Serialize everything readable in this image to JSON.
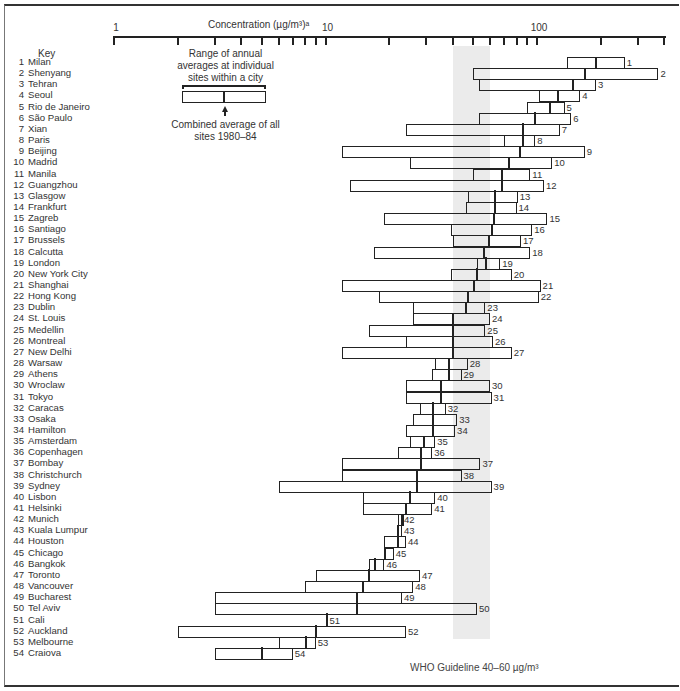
{
  "chart_data": {
    "type": "range-bar",
    "title": "Concentration (µg/m³)ᵃ",
    "xlabel": "Concentration (µg/m³)ᵃ",
    "xscale": "log",
    "xlim": [
      1,
      400
    ],
    "x_tick_labels": [
      "1",
      "10",
      "100"
    ],
    "x_ticks": [
      1,
      2,
      3,
      4,
      5,
      6,
      7,
      8,
      9,
      10,
      20,
      30,
      40,
      50,
      60,
      70,
      80,
      90,
      100,
      200,
      300,
      400
    ],
    "legend": {
      "title": "Key",
      "range_label": "Range of annual averages at individual sites within a city",
      "mid_label": "Combined average of all sites 1980–84"
    },
    "annotation": {
      "text": "WHO Guideline 40–60 µg/m³",
      "range": [
        40,
        60
      ]
    },
    "series": [
      {
        "n": 1,
        "city": "Milan",
        "min": 138,
        "avg": 190,
        "max": 260
      },
      {
        "n": 2,
        "city": "Shenyang",
        "min": 50,
        "avg": 168,
        "max": 375
      },
      {
        "n": 3,
        "city": "Tehran",
        "min": 53,
        "avg": 148,
        "max": 190
      },
      {
        "n": 4,
        "city": "Seoul",
        "min": 102,
        "avg": 125,
        "max": 160
      },
      {
        "n": 5,
        "city": "Rio de Janeiro",
        "min": 90,
        "avg": 115,
        "max": 135
      },
      {
        "n": 6,
        "city": "São Paulo",
        "min": 53,
        "avg": 97,
        "max": 145
      },
      {
        "n": 7,
        "city": "Xian",
        "min": 24,
        "avg": 85,
        "max": 128
      },
      {
        "n": 8,
        "city": "Paris",
        "min": 70,
        "avg": 85,
        "max": 98
      },
      {
        "n": 9,
        "city": "Beijing",
        "min": 12,
        "avg": 83,
        "max": 168
      },
      {
        "n": 10,
        "city": "Madrid",
        "min": 25,
        "avg": 73,
        "max": 118
      },
      {
        "n": 11,
        "city": "Manila",
        "min": 50,
        "avg": 68,
        "max": 93
      },
      {
        "n": 12,
        "city": "Guangzhou",
        "min": 13,
        "avg": 68,
        "max": 108
      },
      {
        "n": 13,
        "city": "Glasgow",
        "min": 47,
        "avg": 63,
        "max": 81
      },
      {
        "n": 14,
        "city": "Frankfurt",
        "min": 46,
        "avg": 63,
        "max": 80
      },
      {
        "n": 15,
        "city": "Zagreb",
        "min": 19,
        "avg": 62,
        "max": 112
      },
      {
        "n": 16,
        "city": "Santiago",
        "min": 39,
        "avg": 61,
        "max": 95
      },
      {
        "n": 17,
        "city": "Brussels",
        "min": 40,
        "avg": 59,
        "max": 84
      },
      {
        "n": 18,
        "city": "Calcutta",
        "min": 17,
        "avg": 56,
        "max": 93
      },
      {
        "n": 19,
        "city": "London",
        "min": 52,
        "avg": 57,
        "max": 67
      },
      {
        "n": 20,
        "city": "New York City",
        "min": 39,
        "avg": 52,
        "max": 76
      },
      {
        "n": 21,
        "city": "Shanghai",
        "min": 12,
        "avg": 50,
        "max": 104
      },
      {
        "n": 22,
        "city": "Hong Kong",
        "min": 18,
        "avg": 47,
        "max": 102
      },
      {
        "n": 23,
        "city": "Dublin",
        "min": 26,
        "avg": 46,
        "max": 57
      },
      {
        "n": 24,
        "city": "St. Louis",
        "min": 26,
        "avg": 40,
        "max": 60
      },
      {
        "n": 25,
        "city": "Medellin",
        "min": 16,
        "avg": 40,
        "max": 57
      },
      {
        "n": 26,
        "city": "Montreal",
        "min": 24,
        "avg": 40,
        "max": 62
      },
      {
        "n": 27,
        "city": "New Delhi",
        "min": 12,
        "avg": 40,
        "max": 76
      },
      {
        "n": 28,
        "city": "Warsaw",
        "min": 33,
        "avg": 38,
        "max": 47
      },
      {
        "n": 29,
        "city": "Athens",
        "min": 32,
        "avg": 38,
        "max": 44
      },
      {
        "n": 30,
        "city": "Wroclaw",
        "min": 24,
        "avg": 35,
        "max": 60
      },
      {
        "n": 31,
        "city": "Tokyo",
        "min": 24,
        "avg": 35,
        "max": 61
      },
      {
        "n": 32,
        "city": "Caracas",
        "min": 28,
        "avg": 32,
        "max": 37
      },
      {
        "n": 33,
        "city": "Osaka",
        "min": 26,
        "avg": 32,
        "max": 42
      },
      {
        "n": 34,
        "city": "Hamilton",
        "min": 24,
        "avg": 32,
        "max": 41
      },
      {
        "n": 35,
        "city": "Amsterdam",
        "min": 25,
        "avg": 29,
        "max": 33
      },
      {
        "n": 36,
        "city": "Copenhagen",
        "min": 22,
        "avg": 28,
        "max": 32
      },
      {
        "n": 37,
        "city": "Bombay",
        "min": 12,
        "avg": 28,
        "max": 54
      },
      {
        "n": 38,
        "city": "Christchurch",
        "min": 12,
        "avg": 27,
        "max": 44
      },
      {
        "n": 39,
        "city": "Sydney",
        "min": 6,
        "avg": 27,
        "max": 61
      },
      {
        "n": 40,
        "city": "Lisbon",
        "min": 15,
        "avg": 25,
        "max": 33
      },
      {
        "n": 41,
        "city": "Helsinki",
        "min": 15,
        "avg": 24,
        "max": 32
      },
      {
        "n": 42,
        "city": "Munich",
        "min": 22,
        "avg": 23,
        "max": 23
      },
      {
        "n": 43,
        "city": "Kuala Lumpur",
        "min": 22,
        "avg": 22,
        "max": 23
      },
      {
        "n": 44,
        "city": "Houston",
        "min": 19,
        "avg": 22,
        "max": 24
      },
      {
        "n": 45,
        "city": "Chicago",
        "min": 19,
        "avg": 19,
        "max": 21
      },
      {
        "n": 46,
        "city": "Bangkok",
        "min": 16,
        "avg": 17,
        "max": 19
      },
      {
        "n": 47,
        "city": "Toronto",
        "min": 9,
        "avg": 16,
        "max": 28
      },
      {
        "n": 48,
        "city": "Vancouver",
        "min": 8,
        "avg": 15,
        "max": 26
      },
      {
        "n": 49,
        "city": "Bucharest",
        "min": 3,
        "avg": 14,
        "max": 23
      },
      {
        "n": 50,
        "city": "Tel Aviv",
        "min": 3,
        "avg": 14,
        "max": 52
      },
      {
        "n": 51,
        "city": "Cali",
        "min": 10,
        "avg": 10,
        "max": 10
      },
      {
        "n": 52,
        "city": "Auckland",
        "min": 2,
        "avg": 9,
        "max": 24
      },
      {
        "n": 53,
        "city": "Melbourne",
        "min": 6,
        "avg": 8,
        "max": 9
      },
      {
        "n": 54,
        "city": "Craiova",
        "min": 3,
        "avg": 5,
        "max": 7
      }
    ]
  }
}
